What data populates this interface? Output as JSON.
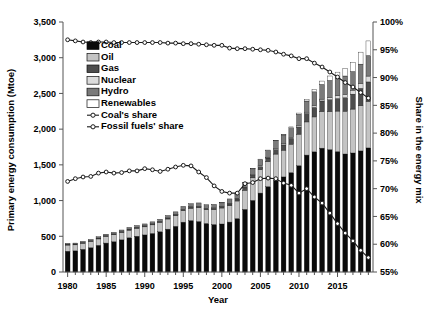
{
  "chart_data": {
    "type": "bar",
    "title": "",
    "xlabel": "Year",
    "ylabel": "Primary energy consumption (Mtoe)",
    "ylabel_right": "Share in the energy mix",
    "xlim": [
      1979.4,
      2019.6
    ],
    "ylim": [
      0,
      3500
    ],
    "ylim_right": [
      55,
      100
    ],
    "grid": false,
    "legend_position": "upper-left-inside",
    "x_tick_labels": [
      "1980",
      "1985",
      "1990",
      "1995",
      "2000",
      "2005",
      "2010",
      "2015"
    ],
    "x_tick_values": [
      1980,
      1985,
      1990,
      1995,
      2000,
      2005,
      2010,
      2015
    ],
    "y_tick_labels": [
      "0",
      "500",
      "1,000",
      "1,500",
      "2,000",
      "2,500",
      "3,000",
      "3,500"
    ],
    "y_tick_values": [
      0,
      500,
      1000,
      1500,
      2000,
      2500,
      3000,
      3500
    ],
    "y_right_tick_labels": [
      "55%",
      "60%",
      "65%",
      "70%",
      "75%",
      "80%",
      "85%",
      "90%",
      "95%",
      "100%"
    ],
    "y_right_tick_values": [
      55,
      60,
      65,
      70,
      75,
      80,
      85,
      90,
      95,
      100
    ],
    "categories": [
      1980,
      1981,
      1982,
      1983,
      1984,
      1985,
      1986,
      1987,
      1988,
      1989,
      1990,
      1991,
      1992,
      1993,
      1994,
      1995,
      1996,
      1997,
      1998,
      1999,
      2000,
      2001,
      2002,
      2003,
      2004,
      2005,
      2006,
      2007,
      2008,
      2009,
      2010,
      2011,
      2012,
      2013,
      2014,
      2015,
      2016,
      2017,
      2018,
      2019
    ],
    "series": [
      {
        "name": "Coal",
        "color": "#0a0a0a",
        "values": [
          291,
          296,
          318,
          340,
          374,
          405,
          424,
          450,
          479,
          501,
          519,
          540,
          563,
          600,
          640,
          698,
          720,
          707,
          680,
          665,
          672,
          699,
          748,
          877,
          1003,
          1105,
          1195,
          1283,
          1331,
          1391,
          1488,
          1637,
          1682,
          1734,
          1713,
          1685,
          1652,
          1666,
          1695,
          1737
        ]
      },
      {
        "name": "Oil",
        "color": "#c4c4c4",
        "values": [
          86,
          84,
          84,
          86,
          89,
          91,
          97,
          102,
          107,
          111,
          113,
          120,
          131,
          142,
          148,
          160,
          173,
          193,
          191,
          208,
          224,
          228,
          246,
          268,
          315,
          327,
          350,
          368,
          375,
          399,
          442,
          464,
          489,
          513,
          534,
          568,
          600,
          615,
          633,
          651
        ]
      },
      {
        "name": "Gas",
        "color": "#4d4d4d",
        "values": [
          12,
          11,
          11,
          11,
          12,
          12,
          12,
          13,
          14,
          14,
          14,
          14,
          14,
          15,
          15,
          16,
          17,
          18,
          19,
          20,
          22,
          27,
          29,
          33,
          38,
          43,
          51,
          63,
          73,
          81,
          98,
          118,
          133,
          148,
          165,
          175,
          187,
          209,
          243,
          273
        ]
      },
      {
        "name": "Nuclear",
        "color": "#dcdcdc",
        "values": [
          0,
          0,
          0,
          0,
          0,
          0,
          0,
          0,
          0,
          0,
          0,
          0,
          0,
          0,
          1,
          3,
          3,
          3,
          3,
          4,
          4,
          4,
          6,
          10,
          11,
          12,
          12,
          14,
          15,
          16,
          17,
          19,
          22,
          25,
          30,
          39,
          48,
          56,
          67,
          82
        ]
      },
      {
        "name": "Hydro",
        "color": "#7a7a7a",
        "values": [
          13,
          14,
          16,
          19,
          19,
          21,
          22,
          23,
          24,
          25,
          27,
          28,
          30,
          34,
          38,
          42,
          44,
          46,
          49,
          50,
          50,
          63,
          65,
          66,
          80,
          91,
          96,
          109,
          125,
          132,
          163,
          156,
          196,
          206,
          240,
          250,
          257,
          261,
          272,
          288
        ]
      },
      {
        "name": "Renewables",
        "color": "#ffffff",
        "values": [
          0,
          0,
          0,
          0,
          0,
          0,
          0,
          0,
          0,
          0,
          0,
          0,
          0,
          0,
          0,
          0,
          0,
          0,
          0,
          1,
          1,
          1,
          1,
          1,
          2,
          2,
          3,
          5,
          8,
          12,
          17,
          24,
          33,
          47,
          62,
          81,
          101,
          130,
          168,
          204
        ]
      }
    ],
    "lines": [
      {
        "name": "Coal's share",
        "axis": "right",
        "marker": "open-circle",
        "values": [
          71.3,
          71.8,
          72.1,
          72.2,
          72.8,
          73.0,
          72.8,
          72.9,
          73.2,
          73.2,
          73.6,
          73.4,
          73.1,
          73.5,
          73.9,
          74.2,
          74.1,
          73.0,
          72.0,
          70.5,
          69.5,
          69.2,
          69.2,
          70.9,
          71.1,
          71.8,
          71.9,
          71.8,
          71.0,
          70.6,
          69.2,
          70.0,
          68.5,
          67.4,
          65.6,
          63.7,
          62.0,
          60.6,
          58.9,
          57.6
        ]
      },
      {
        "name": "Fossil fuels' share",
        "axis": "right",
        "marker": "open-circle",
        "values": [
          96.8,
          96.6,
          96.4,
          96.3,
          96.4,
          96.4,
          96.3,
          96.3,
          96.3,
          96.3,
          96.3,
          96.3,
          96.3,
          96.2,
          96.2,
          96.1,
          96.1,
          96.0,
          95.9,
          95.8,
          95.8,
          95.3,
          95.2,
          95.2,
          95.1,
          95.0,
          94.9,
          94.6,
          94.2,
          93.9,
          93.4,
          93.4,
          92.6,
          91.9,
          91.0,
          90.1,
          89.1,
          88.3,
          87.3,
          86.3
        ]
      }
    ],
    "legend": [
      {
        "label": "Coal",
        "type": "swatch",
        "color": "#0a0a0a"
      },
      {
        "label": "Oil",
        "type": "swatch",
        "color": "#c4c4c4"
      },
      {
        "label": "Gas",
        "type": "swatch",
        "color": "#4d4d4d"
      },
      {
        "label": "Nuclear",
        "type": "swatch",
        "color": "#dcdcdc"
      },
      {
        "label": "Hydro",
        "type": "swatch",
        "color": "#7a7a7a"
      },
      {
        "label": "Renewables",
        "type": "swatch",
        "color": "#ffffff"
      },
      {
        "label": "Coal's share",
        "type": "line-marker",
        "color": "#1a1a1a"
      },
      {
        "label": "Fossil fuels' share",
        "type": "line-marker",
        "color": "#1a1a1a"
      }
    ]
  }
}
